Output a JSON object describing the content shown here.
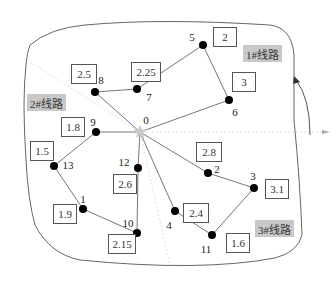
{
  "diagram": {
    "type": "vehicle-routing-network",
    "depot": {
      "id": "0",
      "x": 140,
      "y": 132
    },
    "nodes": [
      {
        "id": "8",
        "x": 95,
        "y": 92,
        "demand": "2.5",
        "label_dx": 6,
        "label_dy": -12,
        "box": {
          "x": 71,
          "y": 64,
          "w": 26,
          "h": 20
        }
      },
      {
        "id": "7",
        "x": 137,
        "y": 89,
        "demand": "2.25",
        "label_dx": 12,
        "label_dy": 8,
        "box": {
          "x": 131,
          "y": 62,
          "w": 30,
          "h": 20
        }
      },
      {
        "id": "5",
        "x": 203,
        "y": 45,
        "demand": "2",
        "label_dx": -11,
        "label_dy": -8,
        "box": {
          "x": 213,
          "y": 27,
          "w": 24,
          "h": 20
        }
      },
      {
        "id": "6",
        "x": 229,
        "y": 100,
        "demand": "3",
        "label_dx": 6,
        "label_dy": 12,
        "box": {
          "x": 232,
          "y": 72,
          "w": 24,
          "h": 20
        }
      },
      {
        "id": "9",
        "x": 96,
        "y": 132,
        "demand": "1.8",
        "label_dx": -3,
        "label_dy": -10,
        "box": {
          "x": 61,
          "y": 117,
          "w": 24,
          "h": 20
        }
      },
      {
        "id": "13",
        "x": 54,
        "y": 166,
        "demand": "1.5",
        "label_dx": 14,
        "label_dy": -1,
        "box": {
          "x": 30,
          "y": 141,
          "w": 24,
          "h": 20
        }
      },
      {
        "id": "1",
        "x": 83,
        "y": 209,
        "demand": "1.9",
        "label_dx": 0,
        "label_dy": -10,
        "box": {
          "x": 53,
          "y": 204,
          "w": 24,
          "h": 20
        }
      },
      {
        "id": "10",
        "x": 137,
        "y": 233,
        "demand": "2.15",
        "label_dx": -9,
        "label_dy": -10,
        "box": {
          "x": 108,
          "y": 234,
          "w": 28,
          "h": 20
        }
      },
      {
        "id": "12",
        "x": 138,
        "y": 168,
        "demand": "2.6",
        "label_dx": -14,
        "label_dy": -6,
        "box": {
          "x": 113,
          "y": 174,
          "w": 24,
          "h": 20
        }
      },
      {
        "id": "2",
        "x": 208,
        "y": 173,
        "demand": "2.8",
        "label_dx": 9,
        "label_dy": -4,
        "box": {
          "x": 196,
          "y": 142,
          "w": 26,
          "h": 20
        }
      },
      {
        "id": "3",
        "x": 254,
        "y": 188,
        "demand": "3.1",
        "label_dx": -1,
        "label_dy": -12,
        "box": {
          "x": 265,
          "y": 179,
          "w": 24,
          "h": 20
        }
      },
      {
        "id": "4",
        "x": 175,
        "y": 211,
        "demand": "2.4",
        "label_dx": -6,
        "label_dy": 14,
        "box": {
          "x": 183,
          "y": 203,
          "w": 26,
          "h": 20
        }
      },
      {
        "id": "11",
        "x": 212,
        "y": 235,
        "demand": "1.6",
        "label_dx": -6,
        "label_dy": 14,
        "box": {
          "x": 226,
          "y": 233,
          "w": 24,
          "h": 20
        }
      }
    ],
    "routes": [
      {
        "name": "1#线路",
        "path": [
          "0",
          "8",
          "7",
          "5",
          "6",
          "0"
        ],
        "tag": {
          "x": 243,
          "y": 45
        }
      },
      {
        "name": "2#线路",
        "path": [
          "0",
          "9",
          "13",
          "1",
          "10",
          "12",
          "0"
        ],
        "tag": {
          "x": 27,
          "y": 94
        }
      },
      {
        "name": "3#线路",
        "path": [
          "0",
          "2",
          "3",
          "11",
          "4",
          "0"
        ],
        "tag": {
          "x": 255,
          "y": 220
        }
      }
    ],
    "colors": {
      "edge": "#777777",
      "node": "#000000",
      "depot": "#c8c8c8",
      "boundary": "#666666",
      "dashed": "#dddddd",
      "route_tag_bg": "#c8c8c8"
    }
  }
}
